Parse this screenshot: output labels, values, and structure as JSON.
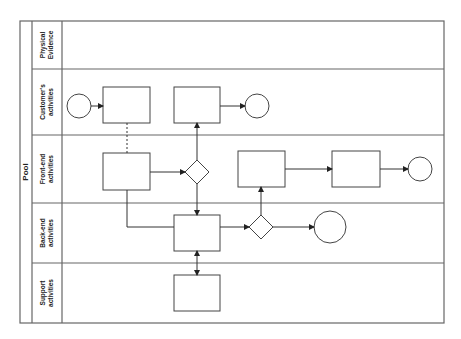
{
  "pool": {
    "label": "Pool"
  },
  "lanes": [
    {
      "id": "physical",
      "line1": "Physical",
      "line2": "Evidence"
    },
    {
      "id": "customer",
      "line1": "Customer's",
      "line2": "activities"
    },
    {
      "id": "frontend",
      "line1": "Front-end",
      "line2": "activities"
    },
    {
      "id": "backend",
      "line1": "Back-end",
      "line2": "activities"
    },
    {
      "id": "support",
      "line1": "Support",
      "line2": "activities"
    }
  ],
  "colors": {
    "stroke": "#555555",
    "text": "#222222",
    "background": "#ffffff"
  }
}
